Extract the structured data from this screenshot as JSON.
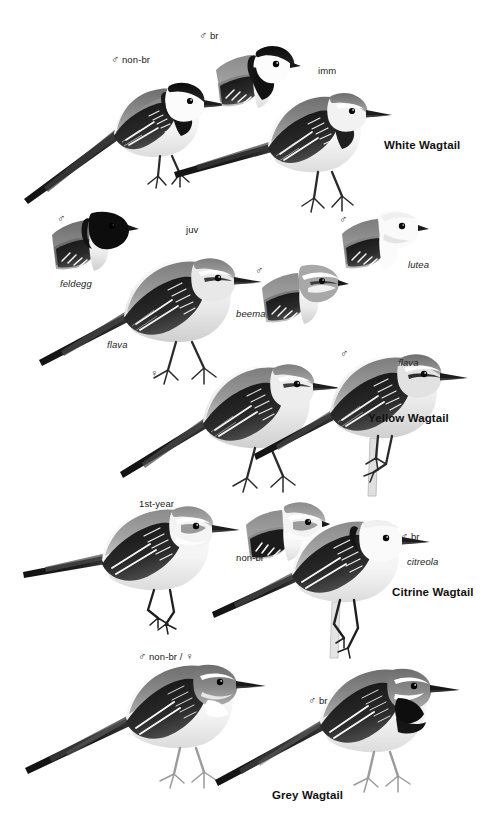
{
  "plate": {
    "title": "Wagtails",
    "background_color": "#ffffff",
    "ink_color": "#1a1a1a",
    "width": 488,
    "height": 815
  },
  "sections": [
    {
      "species_label": "White Wagtail",
      "figures": [
        {
          "label": "♂ non-br",
          "kind": "full",
          "pose": "standing-left"
        },
        {
          "label": "♂ br",
          "kind": "head",
          "pose": "head-left"
        },
        {
          "label": "imm",
          "kind": "full",
          "pose": "standing-left"
        }
      ]
    },
    {
      "species_label": "Yellow Wagtail",
      "figures": [
        {
          "label": "♂",
          "sub_label": "feldegg",
          "kind": "head",
          "pose": "head-left"
        },
        {
          "label": "juv",
          "sub_label": "flava",
          "kind": "full",
          "pose": "standing-left"
        },
        {
          "label": "♂",
          "sub_label": "beema",
          "kind": "head",
          "pose": "head-left"
        },
        {
          "label": "♂",
          "sub_label": "lutea",
          "kind": "head",
          "pose": "head-left"
        },
        {
          "label": "♀",
          "kind": "full",
          "pose": "standing-left"
        },
        {
          "label": "♂",
          "sub_label": "flava",
          "kind": "full",
          "pose": "perched-left"
        }
      ]
    },
    {
      "species_label": "Citrine Wagtail",
      "figures": [
        {
          "label": "1st-year",
          "kind": "full",
          "pose": "standing-left"
        },
        {
          "label": "non-br",
          "kind": "head",
          "pose": "head-left"
        },
        {
          "label": "♂ br",
          "sub_label": "citreola",
          "kind": "full",
          "pose": "perched-left"
        }
      ]
    },
    {
      "species_label": "Grey Wagtail",
      "figures": [
        {
          "label": "♂ non-br / ♀",
          "kind": "full",
          "pose": "standing-left"
        },
        {
          "label": "♂ br",
          "kind": "full",
          "pose": "standing-left"
        }
      ]
    }
  ],
  "labels": {
    "white_male_nonbr": "♂ non-br",
    "white_male_br": "♂ br",
    "white_imm": "imm",
    "white_species": "White Wagtail",
    "yellow_male_feldegg_sex": "♂",
    "yellow_feldegg": "feldegg",
    "yellow_juv": "juv",
    "yellow_male_beema_sex": "♂",
    "yellow_beema": "beema",
    "yellow_male_lutea_sex": "♂",
    "yellow_lutea": "lutea",
    "yellow_flava_left": "flava",
    "yellow_female": "♀",
    "yellow_male_flava_sex": "♂",
    "yellow_flava_right": "flava",
    "yellow_species": "Yellow Wagtail",
    "citrine_first_year": "1st-year",
    "citrine_nonbr": "non-br",
    "citrine_male_br": "♂ br",
    "citrine_citreola": "citreola",
    "citrine_species": "Citrine Wagtail",
    "grey_male_nonbr_female": "♂ non-br / ♀",
    "grey_male_br": "♂ br",
    "grey_species": "Grey Wagtail"
  }
}
